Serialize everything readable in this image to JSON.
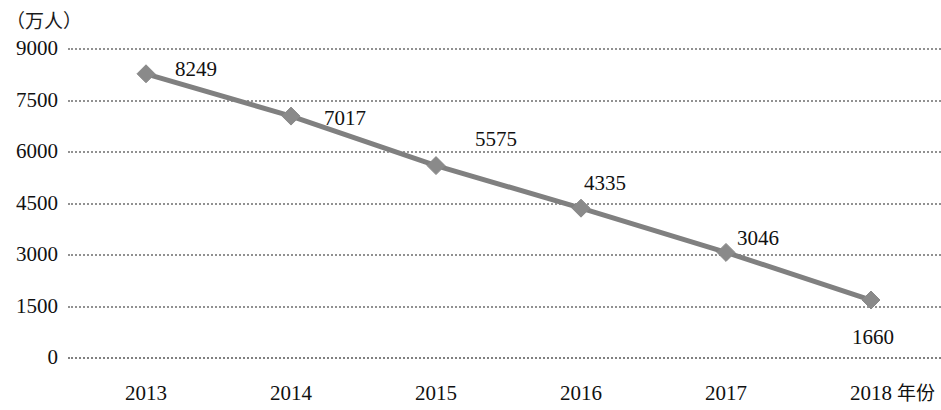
{
  "chart_data": {
    "type": "line",
    "title": "",
    "subtitle": "",
    "xlabel": "年份",
    "ylabel": "（万人）",
    "categories": [
      "2013",
      "2014",
      "2015",
      "2016",
      "2017",
      "2018"
    ],
    "values": [
      8249,
      7017,
      5575,
      4335,
      3046,
      1660
    ],
    "series": [
      {
        "name": "",
        "values": [
          8249,
          7017,
          5575,
          4335,
          3046,
          1660
        ]
      }
    ],
    "point_labels": [
      "8249",
      "7017",
      "5575",
      "4335",
      "3046",
      "1660"
    ],
    "ylim": [
      0,
      9000
    ],
    "yticks": [
      9000,
      7500,
      6000,
      4500,
      3000,
      1500,
      0
    ],
    "ytick_labels": [
      "9000",
      "7500",
      "6000",
      "4500",
      "3000",
      "1500",
      "0"
    ],
    "xtick_labels": [
      "2013",
      "2014",
      "2015",
      "2016",
      "2017",
      "2018"
    ],
    "grid": true,
    "grid_style": "dotted",
    "legend": false,
    "legend_position": "none",
    "marker": "diamond",
    "line_color": "#808080",
    "marker_color": "#8a8a8a",
    "grid_color": "#8c8c8c",
    "text_color": "#111111",
    "background_color": "#ffffff"
  },
  "axis": {
    "unit_caption": "（万人）",
    "x_title": "年份"
  }
}
